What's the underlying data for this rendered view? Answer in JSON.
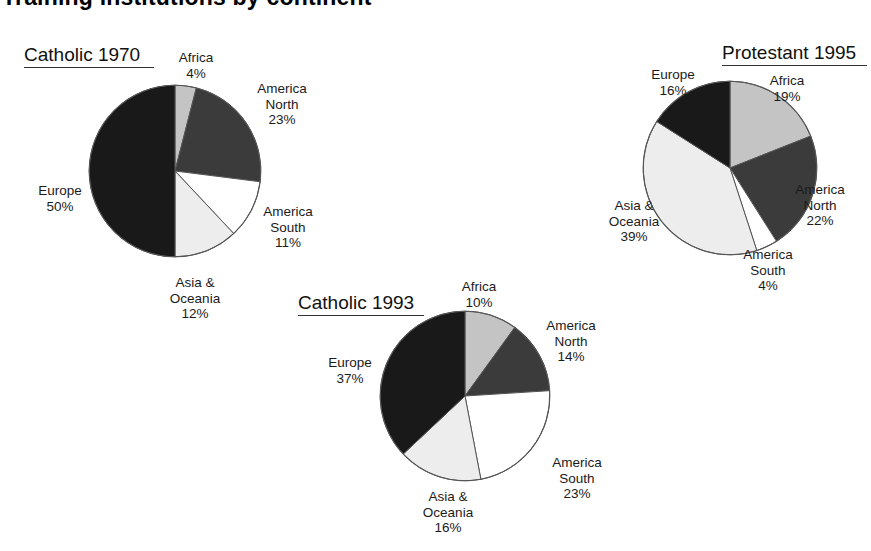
{
  "page": {
    "heading": "Training institutions by continent",
    "background": "#ffffff"
  },
  "palette": {
    "africa": "#c4c4c4",
    "america_north": "#3b3b3b",
    "america_south": "#ffffff",
    "asia_oceania": "#ededed",
    "europe": "#191919",
    "outline": "#555555"
  },
  "chart_data": [
    {
      "type": "pie",
      "id": "catholic-1970",
      "title": "Catholic 1970",
      "categories": [
        "Africa",
        "America North",
        "America South",
        "Asia & Oceania",
        "Europe"
      ],
      "values": [
        4,
        23,
        11,
        12,
        50
      ],
      "unit": "%",
      "start_angle_deg": 0,
      "direction": "clockwise",
      "labels": [
        {
          "name": "Africa",
          "name2": "",
          "pct": "4%"
        },
        {
          "name": "America",
          "name2": "North",
          "pct": "23%"
        },
        {
          "name": "America",
          "name2": "South",
          "pct": "11%"
        },
        {
          "name": "Asia &",
          "name2": "Oceania",
          "pct": "12%"
        },
        {
          "name": "Europe",
          "name2": "",
          "pct": "50%"
        }
      ]
    },
    {
      "type": "pie",
      "id": "catholic-1993",
      "title": "Catholic 1993",
      "categories": [
        "Africa",
        "America North",
        "America South",
        "Asia & Oceania",
        "Europe"
      ],
      "values": [
        10,
        14,
        23,
        16,
        37
      ],
      "unit": "%",
      "start_angle_deg": 0,
      "direction": "clockwise",
      "labels": [
        {
          "name": "Africa",
          "name2": "",
          "pct": "10%"
        },
        {
          "name": "America",
          "name2": "North",
          "pct": "14%"
        },
        {
          "name": "America",
          "name2": "South",
          "pct": "23%"
        },
        {
          "name": "Asia &",
          "name2": "Oceania",
          "pct": "16%"
        },
        {
          "name": "Europe",
          "name2": "",
          "pct": "37%"
        }
      ]
    },
    {
      "type": "pie",
      "id": "protestant-1995",
      "title": "Protestant 1995",
      "categories": [
        "Africa",
        "America North",
        "America South",
        "Asia & Oceania",
        "Europe"
      ],
      "values": [
        19,
        22,
        4,
        39,
        16
      ],
      "unit": "%",
      "start_angle_deg": 0,
      "direction": "clockwise",
      "labels": [
        {
          "name": "Africa",
          "name2": "",
          "pct": "19%"
        },
        {
          "name": "America",
          "name2": "North",
          "pct": "22%"
        },
        {
          "name": "America",
          "name2": "South",
          "pct": "4%"
        },
        {
          "name": "Asia &",
          "name2": "Oceania",
          "pct": "39%"
        },
        {
          "name": "Europe",
          "name2": "",
          "pct": "16%"
        }
      ]
    }
  ]
}
